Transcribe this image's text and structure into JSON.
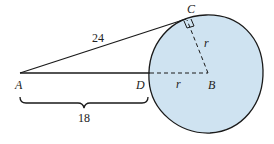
{
  "diagram": {
    "type": "geometry",
    "colors": {
      "circle_fill": "#cfe3f1",
      "stroke": "#1a1a1a"
    },
    "points": {
      "A": {
        "label": "A",
        "x": 20,
        "y": 73
      },
      "B": {
        "label": "B",
        "x": 208,
        "y": 73
      },
      "C": {
        "label": "C",
        "x": 186,
        "y": 18
      },
      "D": {
        "label": "D",
        "x": 150,
        "y": 73
      }
    },
    "circle": {
      "center": "B",
      "cx": 207,
      "cy": 74,
      "rx": 57,
      "ry": 59
    },
    "segments": [
      {
        "from": "A",
        "to": "C",
        "label": "24",
        "style": "solid"
      },
      {
        "from": "A",
        "to": "D",
        "style": "solid"
      },
      {
        "from": "D",
        "to": "B",
        "label": "r",
        "style": "dashed"
      },
      {
        "from": "B",
        "to": "C",
        "label": "r",
        "style": "dashed"
      }
    ],
    "right_angle_at": "C",
    "brace": {
      "from": "A",
      "to": "D",
      "label": "18"
    },
    "labels": {
      "A": "A",
      "B": "B",
      "C": "C",
      "D": "D",
      "AC": "24",
      "AD": "18",
      "radius_CB": "r",
      "radius_DB": "r"
    }
  }
}
